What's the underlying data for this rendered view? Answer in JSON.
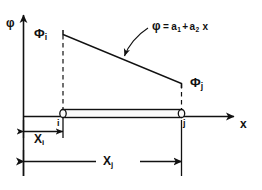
{
  "figure": {
    "axes": {
      "y_label": "φ",
      "x_label": "x"
    },
    "labels": {
      "phi_i": "Φ",
      "phi_i_sub": "i",
      "phi_j": "Φ",
      "phi_j_sub": "j",
      "node_i": "i",
      "node_j": "j",
      "dim_xi": "X",
      "dim_xi_sub": "i",
      "dim_xj": "X",
      "dim_xj_sub": "j"
    },
    "equation": {
      "lhs": "φ",
      "eq_sign": "=",
      "term1": "a",
      "term1_sub": "1",
      "plus": "+",
      "term2": "a",
      "term2_sub": "2",
      "variable": "x"
    },
    "colors": {
      "ink": "#111111",
      "background": "#ffffff",
      "element_fill": "#fbfbfb"
    }
  }
}
